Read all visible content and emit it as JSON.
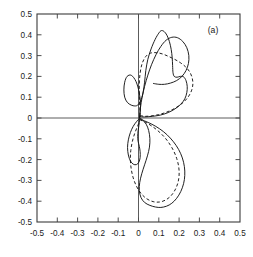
{
  "figure": {
    "panel_label": "(a)",
    "background_color": "#ffffff",
    "frame_color": "#3b3b3b",
    "curve_color": "#141414"
  },
  "chart_data": {
    "type": "line",
    "title": "",
    "subtitle": "",
    "xlabel": "",
    "ylabel": "",
    "annotations": [
      "(a)"
    ],
    "grid": false,
    "legend": null,
    "legend_position": "none",
    "xlim": [
      -0.5,
      0.5
    ],
    "ylim": [
      -0.5,
      0.5
    ],
    "xticks": [
      -0.5,
      -0.4,
      -0.3,
      -0.2,
      -0.1,
      0,
      0.1,
      0.2,
      0.3,
      0.4,
      0.5
    ],
    "yticks": [
      0.5,
      0.4,
      0.3,
      0.2,
      0.1,
      0,
      -0.1,
      -0.2,
      -0.3,
      -0.4,
      -0.5
    ],
    "xtick_labels": [
      "-0.5",
      "-0.4",
      "-0.3",
      "-0.2",
      "-0.1",
      "0",
      "0.1",
      "0.2",
      "0.3",
      "0.4",
      "0.5"
    ],
    "ytick_labels": [
      "0.5",
      "0.4",
      "0.3",
      "0.2",
      "0.1",
      "0",
      "-0.1",
      "-0.2",
      "-0.3",
      "-0.4",
      "-0.5"
    ],
    "axis_crosshair": {
      "x": 0,
      "y": 0
    },
    "series": [
      {
        "name": "solid-curve",
        "style": "solid",
        "closed": true,
        "points": [
          [
            0.005,
            0.005
          ],
          [
            0.01,
            0.06
          ],
          [
            0.004,
            0.12
          ],
          [
            -0.012,
            0.175
          ],
          [
            -0.035,
            0.205
          ],
          [
            -0.056,
            0.2
          ],
          [
            -0.068,
            0.172
          ],
          [
            -0.072,
            0.135
          ],
          [
            -0.068,
            0.1
          ],
          [
            -0.055,
            0.075
          ],
          [
            -0.036,
            0.062
          ],
          [
            -0.018,
            0.058
          ],
          [
            -0.004,
            0.062
          ],
          [
            0.01,
            0.082
          ],
          [
            0.022,
            0.12
          ],
          [
            0.03,
            0.172
          ],
          [
            0.036,
            0.228
          ],
          [
            0.046,
            0.282
          ],
          [
            0.062,
            0.332
          ],
          [
            0.082,
            0.378
          ],
          [
            0.1,
            0.408
          ],
          [
            0.112,
            0.42
          ],
          [
            0.126,
            0.416
          ],
          [
            0.14,
            0.398
          ],
          [
            0.152,
            0.368
          ],
          [
            0.161,
            0.33
          ],
          [
            0.166,
            0.29
          ],
          [
            0.168,
            0.252
          ],
          [
            0.17,
            0.218
          ],
          [
            0.176,
            0.2
          ],
          [
            0.19,
            0.196
          ],
          [
            0.206,
            0.2
          ],
          [
            0.222,
            0.198
          ],
          [
            0.234,
            0.18
          ],
          [
            0.24,
            0.152
          ],
          [
            0.238,
            0.122
          ],
          [
            0.228,
            0.092
          ],
          [
            0.208,
            0.066
          ],
          [
            0.18,
            0.044
          ],
          [
            0.146,
            0.026
          ],
          [
            0.108,
            0.014
          ],
          [
            0.068,
            0.008
          ],
          [
            0.03,
            0.005
          ],
          [
            0.005,
            0.005
          ],
          [
            0.02,
            -0.01
          ],
          [
            0.038,
            -0.03
          ],
          [
            0.05,
            -0.06
          ],
          [
            0.056,
            -0.098
          ],
          [
            0.054,
            -0.14
          ],
          [
            0.044,
            -0.182
          ],
          [
            0.03,
            -0.225
          ],
          [
            0.016,
            -0.268
          ],
          [
            0.006,
            -0.31
          ],
          [
            0.004,
            -0.348
          ],
          [
            0.012,
            -0.382
          ],
          [
            0.03,
            -0.406
          ],
          [
            0.056,
            -0.42
          ],
          [
            0.084,
            -0.428
          ],
          [
            0.11,
            -0.43
          ],
          [
            0.138,
            -0.424
          ],
          [
            0.164,
            -0.41
          ],
          [
            0.188,
            -0.386
          ],
          [
            0.208,
            -0.354
          ],
          [
            0.222,
            -0.316
          ],
          [
            0.228,
            -0.276
          ],
          [
            0.226,
            -0.234
          ],
          [
            0.216,
            -0.192
          ],
          [
            0.198,
            -0.152
          ],
          [
            0.172,
            -0.114
          ],
          [
            0.14,
            -0.08
          ],
          [
            0.104,
            -0.052
          ],
          [
            0.066,
            -0.03
          ],
          [
            0.03,
            -0.014
          ],
          [
            0.005,
            -0.005
          ],
          [
            -0.01,
            -0.018
          ],
          [
            -0.026,
            -0.04
          ],
          [
            -0.04,
            -0.07
          ],
          [
            -0.05,
            -0.105
          ],
          [
            -0.054,
            -0.142
          ],
          [
            -0.05,
            -0.178
          ],
          [
            -0.04,
            -0.206
          ],
          [
            -0.026,
            -0.222
          ],
          [
            -0.01,
            -0.224
          ],
          [
            0.002,
            -0.212
          ],
          [
            0.008,
            -0.19
          ],
          [
            0.008,
            -0.162
          ],
          [
            0.004,
            -0.136
          ],
          [
            -0.002,
            -0.112
          ],
          [
            -0.004,
            -0.088
          ],
          [
            -0.002,
            -0.062
          ],
          [
            0.002,
            -0.036
          ],
          [
            0.005,
            -0.012
          ],
          [
            0.005,
            0.005
          ]
        ]
      },
      {
        "name": "solid-curve-secondary-lobe",
        "style": "solid",
        "closed": false,
        "points": [
          [
            0.006,
            0.008
          ],
          [
            0.01,
            0.052
          ],
          [
            0.018,
            0.1
          ],
          [
            0.03,
            0.152
          ],
          [
            0.046,
            0.206
          ],
          [
            0.064,
            0.256
          ],
          [
            0.086,
            0.304
          ],
          [
            0.11,
            0.344
          ],
          [
            0.136,
            0.374
          ],
          [
            0.164,
            0.388
          ],
          [
            0.192,
            0.386
          ],
          [
            0.218,
            0.368
          ],
          [
            0.238,
            0.338
          ],
          [
            0.248,
            0.3
          ],
          [
            0.246,
            0.262
          ],
          [
            0.234,
            0.228
          ],
          [
            0.214,
            0.2
          ],
          [
            0.188,
            0.18
          ],
          [
            0.158,
            0.168
          ],
          [
            0.128,
            0.162
          ],
          [
            0.1,
            0.162
          ],
          [
            0.074,
            0.166
          ]
        ]
      },
      {
        "name": "dashed-curve",
        "style": "dashed",
        "closed": true,
        "points": [
          [
            0.008,
            0.01
          ],
          [
            0.006,
            0.06
          ],
          [
            0.004,
            0.112
          ],
          [
            0.004,
            0.164
          ],
          [
            0.008,
            0.216
          ],
          [
            0.018,
            0.262
          ],
          [
            0.036,
            0.296
          ],
          [
            0.06,
            0.312
          ],
          [
            0.088,
            0.314
          ],
          [
            0.118,
            0.308
          ],
          [
            0.148,
            0.296
          ],
          [
            0.178,
            0.282
          ],
          [
            0.206,
            0.266
          ],
          [
            0.232,
            0.246
          ],
          [
            0.252,
            0.222
          ],
          [
            0.264,
            0.194
          ],
          [
            0.268,
            0.164
          ],
          [
            0.262,
            0.134
          ],
          [
            0.248,
            0.106
          ],
          [
            0.226,
            0.08
          ],
          [
            0.198,
            0.058
          ],
          [
            0.166,
            0.04
          ],
          [
            0.132,
            0.026
          ],
          [
            0.098,
            0.016
          ],
          [
            0.062,
            0.01
          ],
          [
            0.03,
            0.008
          ],
          [
            0.008,
            0.01
          ],
          [
            0.006,
            -0.012
          ],
          [
            -0.004,
            -0.038
          ],
          [
            -0.018,
            -0.072
          ],
          [
            -0.03,
            -0.112
          ],
          [
            -0.038,
            -0.156
          ],
          [
            -0.04,
            -0.2
          ],
          [
            -0.036,
            -0.244
          ],
          [
            -0.026,
            -0.288
          ],
          [
            -0.01,
            -0.328
          ],
          [
            0.012,
            -0.362
          ],
          [
            0.04,
            -0.388
          ],
          [
            0.072,
            -0.402
          ],
          [
            0.104,
            -0.404
          ],
          [
            0.134,
            -0.394
          ],
          [
            0.16,
            -0.374
          ],
          [
            0.18,
            -0.346
          ],
          [
            0.194,
            -0.312
          ],
          [
            0.2,
            -0.274
          ],
          [
            0.198,
            -0.234
          ],
          [
            0.188,
            -0.194
          ],
          [
            0.172,
            -0.156
          ],
          [
            0.15,
            -0.12
          ],
          [
            0.124,
            -0.088
          ],
          [
            0.094,
            -0.06
          ],
          [
            0.064,
            -0.038
          ],
          [
            0.034,
            -0.02
          ],
          [
            0.008,
            -0.008
          ],
          [
            0.008,
            0.01
          ]
        ]
      }
    ]
  }
}
